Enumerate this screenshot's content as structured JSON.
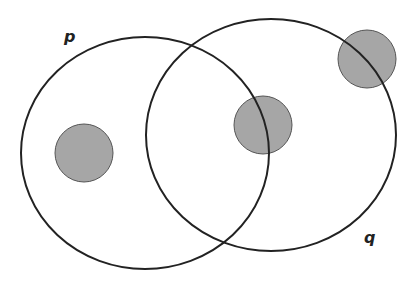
{
  "diagram": {
    "type": "venn",
    "sets": [
      {
        "name": "p",
        "label": "p",
        "cx": 145,
        "cy": 153,
        "rx": 124,
        "ry": 116,
        "label_x": 64,
        "label_y": 42
      },
      {
        "name": "q",
        "label": "q",
        "cx": 271,
        "cy": 135,
        "rx": 125,
        "ry": 116,
        "label_x": 364,
        "label_y": 243
      }
    ],
    "points": [
      {
        "name": "point-in-p-only",
        "cx": 84,
        "cy": 153,
        "r": 29
      },
      {
        "name": "point-on-p-boundary-in-q",
        "cx": 263,
        "cy": 125,
        "r": 29
      },
      {
        "name": "point-on-q-boundary",
        "cx": 367,
        "cy": 59,
        "r": 29
      }
    ],
    "colors": {
      "stroke": "#222222",
      "point_fill": "#a6a6a6",
      "background": "#ffffff"
    }
  }
}
